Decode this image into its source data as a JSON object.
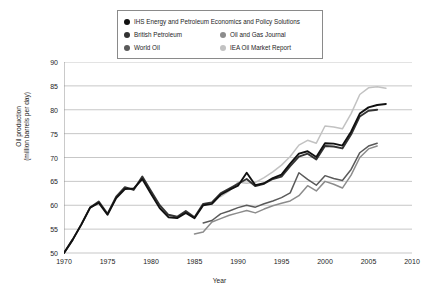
{
  "chart_data": {
    "type": "line",
    "title": "",
    "xlabel": "Year",
    "ylabel": "Oil production\n(million barrels per day)",
    "ylabel_line1": "Oil production",
    "ylabel_line2": "(million barrels per day)",
    "xlim": [
      1970,
      2010
    ],
    "ylim": [
      50,
      90
    ],
    "xticks": [
      1970,
      1975,
      1980,
      1985,
      1990,
      1995,
      2000,
      2005,
      2010
    ],
    "yticks": [
      50,
      55,
      60,
      65,
      70,
      75,
      80,
      85,
      90
    ],
    "grid": "horizontal",
    "legend_position": "top-center",
    "series": [
      {
        "name": "IHS Energy and Petroleum Economics and Policy Solutions",
        "color": "#111111",
        "marker": "circle",
        "x": [
          1970,
          1971,
          1972,
          1973,
          1974,
          1975,
          1976,
          1977,
          1978,
          1979,
          1980,
          1981,
          1982,
          1983,
          1984,
          1985,
          1986,
          1987,
          1988,
          1989,
          1990,
          1991,
          1992,
          1993,
          1994,
          1995,
          1996,
          1997,
          1998,
          1999,
          2000,
          2001,
          2002,
          2003,
          2004,
          2005,
          2006,
          2007
        ],
        "values": [
          50.0,
          52.8,
          56.0,
          59.5,
          60.5,
          58.0,
          61.5,
          63.4,
          63.5,
          65.5,
          62.4,
          59.4,
          57.5,
          57.3,
          58.4,
          57.3,
          60.0,
          60.3,
          62.2,
          63.2,
          64.1,
          66.8,
          64.2,
          64.6,
          65.7,
          66.4,
          68.7,
          70.8,
          71.3,
          70.1,
          73.0,
          72.9,
          72.5,
          75.4,
          79.2,
          80.5,
          81.0,
          81.2
        ]
      },
      {
        "name": "British Petroleum",
        "color": "#333333",
        "marker": "circle",
        "x": [
          1970,
          1971,
          1972,
          1973,
          1974,
          1975,
          1976,
          1977,
          1978,
          1979,
          1980,
          1981,
          1982,
          1983,
          1984,
          1985,
          1986,
          1987,
          1988,
          1989,
          1990,
          1991,
          1992,
          1993,
          1994,
          1995,
          1996,
          1997,
          1998,
          1999,
          2000,
          2001,
          2002,
          2003,
          2004,
          2005,
          2006
        ],
        "values": [
          50.0,
          52.8,
          56.0,
          59.5,
          60.8,
          58.2,
          61.8,
          63.8,
          63.2,
          66.0,
          63.0,
          60.0,
          58.0,
          57.6,
          58.8,
          57.5,
          60.3,
          60.6,
          62.5,
          63.5,
          64.5,
          65.5,
          64.0,
          64.5,
          65.5,
          66.0,
          68.2,
          70.2,
          70.8,
          69.6,
          72.4,
          72.3,
          71.9,
          74.8,
          78.6,
          79.8,
          80.0
        ]
      },
      {
        "name": "World Oil",
        "color": "#5a5a5a",
        "marker": "circle",
        "x": [
          1986,
          1987,
          1988,
          1989,
          1990,
          1991,
          1992,
          1993,
          1994,
          1995,
          1996,
          1997,
          1998,
          1999,
          2000,
          2001,
          2002,
          2003,
          2004,
          2005,
          2006
        ],
        "values": [
          56.3,
          56.8,
          58.2,
          58.8,
          59.5,
          60.0,
          59.6,
          60.3,
          60.9,
          61.6,
          62.6,
          66.8,
          65.4,
          64.2,
          66.2,
          65.6,
          65.2,
          67.5,
          71.0,
          72.4,
          73.0
        ]
      },
      {
        "name": "Oil and Gas Journal",
        "color": "#8c8c8c",
        "marker": "circle",
        "x": [
          1985,
          1986,
          1987,
          1988,
          1989,
          1990,
          1991,
          1992,
          1993,
          1994,
          1995,
          1996,
          1997,
          1998,
          1999,
          2000,
          2001,
          2002,
          2003,
          2004,
          2005,
          2006
        ],
        "values": [
          54.0,
          54.4,
          56.5,
          57.2,
          57.9,
          58.4,
          58.9,
          58.4,
          59.2,
          59.9,
          60.4,
          60.9,
          62.0,
          64.1,
          63.0,
          65.0,
          64.4,
          63.6,
          66.3,
          70.0,
          71.8,
          72.4
        ]
      },
      {
        "name": "IEA Oil Market Report",
        "color": "#c2c2c2",
        "marker": "circle",
        "x": [
          1988,
          1989,
          1990,
          1991,
          1992,
          1993,
          1994,
          1995,
          1996,
          1997,
          1998,
          1999,
          2000,
          2001,
          2002,
          2003,
          2004,
          2005,
          2006,
          2007
        ],
        "values": [
          61.8,
          63.0,
          64.8,
          64.6,
          64.8,
          65.8,
          67.0,
          68.4,
          70.2,
          72.6,
          73.6,
          73.0,
          76.6,
          76.4,
          76.0,
          79.2,
          83.2,
          84.6,
          84.8,
          84.5
        ]
      }
    ],
    "legend_layout": [
      [
        {
          "series": 0
        }
      ],
      [
        {
          "series": 1
        },
        {
          "series": 3
        }
      ],
      [
        {
          "series": 2
        },
        {
          "series": 4
        }
      ]
    ]
  }
}
